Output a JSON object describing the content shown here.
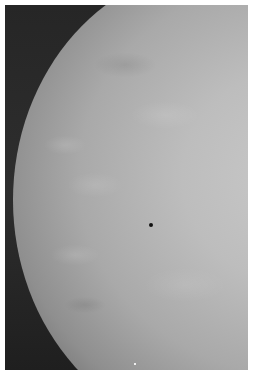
{
  "image": {
    "description": "Grayscale mammogram (X-ray of breast tissue) showing dense fibroglandular tissue with a small dark marker dot near center",
    "colors": {
      "background": "#2a2a2a",
      "tissue_light": "#c9c9c9",
      "border": "#ffffff",
      "marker": "#111111"
    }
  }
}
